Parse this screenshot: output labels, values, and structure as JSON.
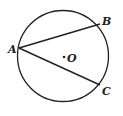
{
  "diagram": {
    "type": "circle-with-chords",
    "stroke_color": "#222222",
    "background": "#ffffff",
    "circle": {
      "center_label": "O"
    },
    "points": [
      {
        "id": "A",
        "label": "A"
      },
      {
        "id": "B",
        "label": "B"
      },
      {
        "id": "C",
        "label": "C"
      }
    ],
    "chords": [
      {
        "from": "A",
        "to": "B"
      },
      {
        "from": "A",
        "to": "C"
      }
    ]
  }
}
